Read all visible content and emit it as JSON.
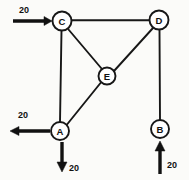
{
  "diagram": {
    "type": "node-flow-graph",
    "nodes": [
      {
        "id": "A",
        "label": "A",
        "cx": 60,
        "cy": 131,
        "r": 9
      },
      {
        "id": "B",
        "label": "B",
        "cx": 160,
        "cy": 129,
        "r": 9
      },
      {
        "id": "C",
        "label": "C",
        "cx": 62,
        "cy": 21,
        "r": 9.5
      },
      {
        "id": "D",
        "label": "D",
        "cx": 159,
        "cy": 20,
        "r": 9.5
      },
      {
        "id": "E",
        "label": "E",
        "cx": 107,
        "cy": 76,
        "r": 8.5
      }
    ],
    "edges": [
      {
        "from": "C",
        "to": "D"
      },
      {
        "from": "C",
        "to": "E"
      },
      {
        "from": "D",
        "to": "E"
      },
      {
        "from": "C",
        "to": "A"
      },
      {
        "from": "E",
        "to": "A"
      },
      {
        "from": "D",
        "to": "B"
      }
    ],
    "flows": [
      {
        "name": "inflow-c",
        "direction": "right",
        "label": "20",
        "attached_node": "C",
        "shaft": {
          "x1": 13,
          "y1": 21,
          "x2": 47,
          "y2": 21
        },
        "head": "52,21 44,16.5 44,25.5",
        "label_pos": {
          "x": 24,
          "y": 10
        }
      },
      {
        "name": "outflow-a-left",
        "direction": "left",
        "label": "20",
        "attached_node": "A",
        "shaft": {
          "x1": 50,
          "y1": 131,
          "x2": 16,
          "y2": 131
        },
        "head": "10,131 19,126.5 19,135.5",
        "label_pos": {
          "x": 23,
          "y": 115
        }
      },
      {
        "name": "outflow-a-down",
        "direction": "down",
        "label": "20",
        "attached_node": "A",
        "shaft": {
          "x1": 62,
          "y1": 142,
          "x2": 62,
          "y2": 164
        },
        "head": "62,172 57,162 67,162",
        "label_pos": {
          "x": 74,
          "y": 168
        }
      },
      {
        "name": "inflow-b-up",
        "direction": "up",
        "label": "20",
        "attached_node": "B",
        "shaft": {
          "x1": 160,
          "y1": 174,
          "x2": 160,
          "y2": 150
        },
        "head": "160,141 155,151 165,151",
        "label_pos": {
          "x": 172,
          "y": 165
        }
      }
    ],
    "flow_value": "20"
  }
}
